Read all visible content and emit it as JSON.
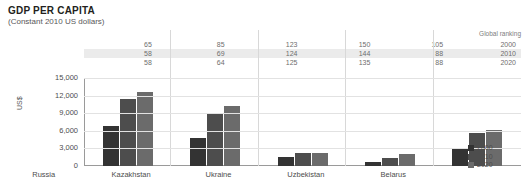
{
  "header": {
    "title": "GDP PER CAPITA",
    "subtitle": "(Constant 2010 US dollars)"
  },
  "ranking_table": {
    "header_label": "Global ranking",
    "years": [
      "2000",
      "2010",
      "2020"
    ],
    "rows": [
      {
        "year": "2000",
        "values": [
          "65",
          "85",
          "123",
          "150",
          "105"
        ]
      },
      {
        "year": "2010",
        "values": [
          "58",
          "69",
          "124",
          "144",
          "88"
        ]
      },
      {
        "year": "2020",
        "values": [
          "58",
          "64",
          "125",
          "135",
          "88"
        ]
      }
    ]
  },
  "legend": {
    "items": [
      {
        "label": "2000",
        "color": "#333333"
      },
      {
        "label": "2010",
        "color": "#4d4d4d"
      },
      {
        "label": "2020",
        "color": "#6b6b6b"
      }
    ]
  },
  "chart_data": {
    "type": "bar",
    "title": "GDP PER CAPITA",
    "subtitle": "(Constant 2010 US dollars)",
    "xlabel": "",
    "ylabel": "US$",
    "ylim": [
      0,
      15000
    ],
    "yticks": [
      "0",
      "3,000",
      "6,000",
      "9,000",
      "12,000",
      "15,000"
    ],
    "ytick_values": [
      0,
      3000,
      6000,
      9000,
      12000,
      15000
    ],
    "grid": true,
    "legend_position": "right",
    "categories": [
      "Russia",
      "Kazakhstan",
      "Ukraine",
      "Uzbekistan",
      "Belarus"
    ],
    "series": [
      {
        "name": "2000",
        "color": "#333333",
        "values": [
          6800,
          4800,
          1500,
          700,
          2900
        ]
      },
      {
        "name": "2010",
        "color": "#4d4d4d",
        "values": [
          11500,
          8900,
          2200,
          1300,
          5700
        ]
      },
      {
        "name": "2020",
        "color": "#6b6b6b",
        "values": [
          12600,
          10200,
          2300,
          2000,
          6200
        ]
      }
    ],
    "annotations": {
      "global_ranking": {
        "2000": [
          65,
          85,
          123,
          150,
          105
        ],
        "2010": [
          58,
          69,
          124,
          144,
          88
        ],
        "2020": [
          58,
          64,
          125,
          135,
          88
        ]
      }
    }
  }
}
